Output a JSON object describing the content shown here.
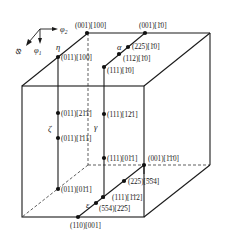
{
  "diagram": {
    "type": "euler-space-cube-fibers",
    "axes": {
      "phi2": "φ₂",
      "phi1": "φ₁",
      "Phi": "Φ"
    },
    "fibers": [
      {
        "id": "eta",
        "symbol": "η"
      },
      {
        "id": "alpha",
        "symbol": "α"
      },
      {
        "id": "zeta",
        "symbol": "ζ"
      },
      {
        "id": "gamma",
        "symbol": "γ"
      },
      {
        "id": "epsilon",
        "symbol": "ε"
      }
    ],
    "orientations": [
      {
        "label": "(001)[100]",
        "fiber": "eta"
      },
      {
        "label": "(001)[1̄0]",
        "fiber": "alpha"
      },
      {
        "label": "(225)[1̄0]",
        "fiber": "alpha"
      },
      {
        "label": "(112)[1̄0]",
        "fiber": "alpha"
      },
      {
        "label": "(111)[1̄0]",
        "fiber": "alpha"
      },
      {
        "label": "(011)[100]",
        "fiber": "eta"
      },
      {
        "label": "(011)[21̄1̄]",
        "fiber": "zeta"
      },
      {
        "label": "(011)[1̄11]",
        "fiber": "zeta"
      },
      {
        "label": "(011)[01̄1]",
        "fiber": "zeta"
      },
      {
        "label": "(111)[12̄1]",
        "fiber": "gamma"
      },
      {
        "label": "(111)[01̄1]",
        "fiber": "gamma"
      },
      {
        "label": "(001)[1̄1̄0]",
        "fiber": "epsilon"
      },
      {
        "label": "(225)[5̄5̄4]",
        "fiber": "epsilon"
      },
      {
        "label": "(111)[1̄1̄2]",
        "fiber": "epsilon"
      },
      {
        "label": "(554)[2̄2̄5]",
        "fiber": "epsilon"
      },
      {
        "label": "(110)[001]",
        "fiber": "epsilon"
      }
    ]
  },
  "labels": {
    "ax_phi2": "φ",
    "ax_phi2_sub": "2",
    "ax_phi1": "φ",
    "ax_phi1_sub": "1",
    "ax_Phi": "Φ",
    "eta": "η",
    "alpha": "α",
    "zeta": "ζ",
    "gamma": "γ",
    "epsilon": "ε",
    "o001_100": "(001)[100]",
    "o001_1b10": "(001)[1̄0]",
    "o225_1b10": "(225)[1̄0]",
    "o112_1b10": "(112)[1̄0]",
    "o111_1b10": "(111)[1̄0]",
    "o011_100": "(011)[100]",
    "o011_21b1b": "(011)[21̄1̄]",
    "o011_1b11": "(011)[1̄11]",
    "o011_01b1": "(011)[01̄1]",
    "o111_12b1": "(111)[12̄1]",
    "o111_01b1": "(111)[01̄1]",
    "o001_1b1b0": "(001)[1̄1̄0]",
    "o225_5b5b4": "(225)[5̄5̄4]",
    "o111_1b1b2": "(111)[1̄1̄2]",
    "o554_2b2b5": "(554)[2̄2̄5]",
    "o110_001": "(110)[001]"
  }
}
